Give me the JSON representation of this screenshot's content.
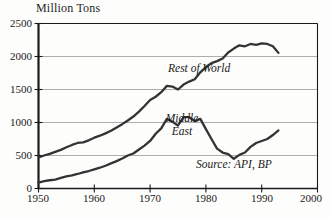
{
  "chart_data": {
    "type": "line",
    "title": "Million Tons",
    "xlabel": "",
    "ylabel": "Million Tons",
    "xlim": [
      1950,
      2000
    ],
    "ylim": [
      0,
      2500
    ],
    "xticks": [
      1950,
      1960,
      1970,
      1980,
      1990,
      2000
    ],
    "yticks": [
      0,
      500,
      1000,
      1500,
      2000,
      2500
    ],
    "grid": "horizontal",
    "legend_position": "inline-annotations",
    "annotations": [
      {
        "text": "Rest of World",
        "x": 1973,
        "y": 1900
      },
      {
        "text": "Middle East",
        "x": 1971,
        "y": 1150
      },
      {
        "text": "Source: API, BP",
        "x": 1985,
        "y": 430
      }
    ],
    "series": [
      {
        "name": "Rest of World",
        "color": "#333333",
        "x": [
          1950,
          1951,
          1952,
          1953,
          1954,
          1955,
          1956,
          1957,
          1958,
          1959,
          1960,
          1961,
          1962,
          1963,
          1964,
          1965,
          1966,
          1967,
          1968,
          1969,
          1970,
          1971,
          1972,
          1973,
          1974,
          1975,
          1976,
          1977,
          1978,
          1979,
          1980,
          1981,
          1982,
          1983,
          1984,
          1985,
          1986,
          1987,
          1988,
          1989,
          1990,
          1991,
          1992,
          1993
        ],
        "values": [
          470,
          500,
          525,
          555,
          585,
          625,
          660,
          690,
          700,
          730,
          770,
          800,
          835,
          875,
          925,
          975,
          1030,
          1090,
          1165,
          1250,
          1340,
          1390,
          1460,
          1555,
          1545,
          1500,
          1575,
          1620,
          1655,
          1760,
          1840,
          1900,
          1930,
          1970,
          2060,
          2120,
          2170,
          2155,
          2190,
          2175,
          2200,
          2190,
          2155,
          2055
        ]
      },
      {
        "name": "Middle East",
        "color": "#333333",
        "x": [
          1950,
          1951,
          1952,
          1953,
          1954,
          1955,
          1956,
          1957,
          1958,
          1959,
          1960,
          1961,
          1962,
          1963,
          1964,
          1965,
          1966,
          1967,
          1968,
          1969,
          1970,
          1971,
          1972,
          1973,
          1974,
          1975,
          1976,
          1977,
          1978,
          1979,
          1980,
          1981,
          1982,
          1983,
          1984,
          1985,
          1986,
          1987,
          1988,
          1989,
          1990,
          1991,
          1992,
          1993
        ],
        "values": [
          90,
          110,
          125,
          135,
          160,
          185,
          200,
          220,
          245,
          265,
          290,
          315,
          345,
          380,
          415,
          455,
          500,
          530,
          590,
          650,
          720,
          830,
          910,
          1055,
          1010,
          955,
          1080,
          1080,
          1020,
          1055,
          900,
          750,
          605,
          545,
          520,
          450,
          510,
          545,
          630,
          690,
          720,
          750,
          810,
          880
        ]
      }
    ]
  },
  "axes": {
    "y_tick_labels": [
      "2500",
      "2000",
      "1500",
      "1000",
      "500",
      "0"
    ],
    "x_tick_labels": [
      "1950",
      "1960",
      "1970",
      "1980",
      "1990",
      "2000"
    ]
  },
  "labels": {
    "rest_of_world": "Rest of World",
    "middle_east_line1": "Middle",
    "middle_east_line2": "East",
    "source": "Source: API, BP"
  }
}
